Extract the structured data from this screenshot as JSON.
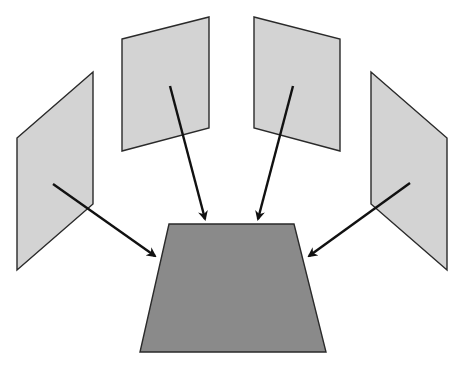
{
  "diagram": {
    "colors": {
      "panel_fill": "#d3d3d3",
      "target_fill": "#8a8a8a",
      "stroke": "#2a2a2a",
      "arrow": "#111111"
    },
    "panels": [
      {
        "id": "far-left",
        "points": "17,138 93,72 93,204 17,270"
      },
      {
        "id": "center-left",
        "points": "122,39 209,17 209,128 122,151"
      },
      {
        "id": "center-right",
        "points": "254,17 340,39 340,151 254,128"
      },
      {
        "id": "far-right",
        "points": "371,72 447,138 447,270 371,204"
      }
    ],
    "target": {
      "points": "169,224 294,224 326,352 140,352"
    },
    "arrows": [
      {
        "from": [
          53,
          184
        ],
        "to": [
          155,
          256
        ]
      },
      {
        "from": [
          170,
          86
        ],
        "to": [
          205,
          219
        ]
      },
      {
        "from": [
          293,
          86
        ],
        "to": [
          258,
          219
        ]
      },
      {
        "from": [
          410,
          183
        ],
        "to": [
          309,
          256
        ]
      }
    ]
  }
}
